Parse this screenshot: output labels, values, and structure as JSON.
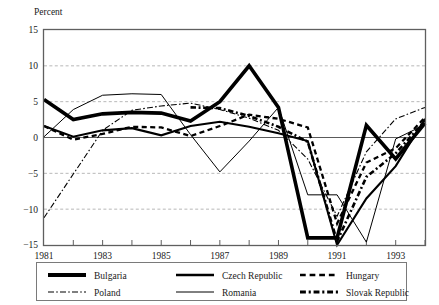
{
  "chart_data": {
    "type": "line",
    "title": "",
    "ylabel": "Percent",
    "xlabel": "",
    "ylim": [
      -15,
      15
    ],
    "xlim": [
      1981,
      1994
    ],
    "y_ticks": [
      15,
      10,
      5,
      0,
      -5,
      -10,
      -15
    ],
    "y_tick_labels": [
      "15",
      "10",
      "5",
      "0",
      "−5",
      "−10",
      "−15"
    ],
    "x_ticks": [
      1981,
      1982,
      1983,
      1984,
      1985,
      1986,
      1987,
      1988,
      1989,
      1990,
      1991,
      1992,
      1993,
      1994
    ],
    "x_tick_labels_shown": [
      "1981",
      "1983",
      "1985",
      "1987",
      "1989",
      "1991",
      "1993"
    ],
    "grid": "horizontal-dashed",
    "legend_position": "below-axes",
    "zero_line": true,
    "x": [
      1981,
      1982,
      1983,
      1984,
      1985,
      1986,
      1987,
      1988,
      1989,
      1990,
      1991,
      1992,
      1993,
      1994
    ],
    "series": [
      {
        "name": "Bulgaria",
        "style": "solid",
        "width": 3.6,
        "values": [
          5.3,
          2.5,
          3.3,
          3.5,
          3.4,
          2.3,
          5.0,
          10.0,
          4.2,
          -14.0,
          -14.0,
          1.7,
          -3.0,
          2.0
        ]
      },
      {
        "name": "Czech Republic",
        "style": "solid",
        "width": 2.1,
        "values": [
          1.6,
          0.1,
          1.0,
          1.3,
          0.3,
          1.6,
          2.2,
          1.5,
          0.6,
          -0.5,
          -15.0,
          -8.5,
          -4.0,
          2.6
        ]
      },
      {
        "name": "Hungary",
        "style": "dashed",
        "width": 2.3,
        "values": [
          1.6,
          -0.3,
          0.5,
          1.5,
          1.4,
          0.2,
          1.6,
          3.2,
          2.6,
          1.4,
          -12.0,
          -3.5,
          -1.5,
          2.8
        ]
      },
      {
        "name": "Poland",
        "style": "dashdot",
        "width": 1.1,
        "values": [
          -11.2,
          -5.1,
          1.0,
          3.8,
          4.4,
          4.8,
          3.9,
          2.7,
          1.0,
          -3.0,
          -11.0,
          -2.0,
          2.6,
          4.2
        ]
      },
      {
        "name": "Romania",
        "style": "solid",
        "width": 1.0,
        "values": [
          0.1,
          3.9,
          5.9,
          6.1,
          6.0,
          0.4,
          -4.8,
          -0.5,
          4.2,
          -8.0,
          -8.0,
          -14.6,
          -0.2,
          1.8
        ]
      },
      {
        "name": "Slovak Republic",
        "style": "dashdotdash",
        "width": 2.6,
        "values": [
          null,
          null,
          null,
          null,
          null,
          4.2,
          4.1,
          3.0,
          1.5,
          -0.6,
          -14.5,
          -5.5,
          -2.2,
          2.3
        ]
      }
    ]
  },
  "axes": {
    "y_axis_title": "Percent"
  },
  "legend": {
    "entries": [
      {
        "label": "Bulgaria",
        "style": "solid",
        "width": 4.2
      },
      {
        "label": "Czech Republic",
        "style": "solid",
        "width": 2.4
      },
      {
        "label": "Hungary",
        "style": "dashed",
        "width": 2.6
      },
      {
        "label": "Poland",
        "style": "dashdot",
        "width": 1.1
      },
      {
        "label": "Romania",
        "style": "solid",
        "width": 1.0
      },
      {
        "label": "Slovak Republic",
        "style": "dashdotdash",
        "width": 2.8
      }
    ]
  },
  "colors": {
    "line": "#000000",
    "grid": "#9a9a9a",
    "frame": "#5f5f5f",
    "text": "#1a1a1a",
    "background": "#ffffff"
  }
}
